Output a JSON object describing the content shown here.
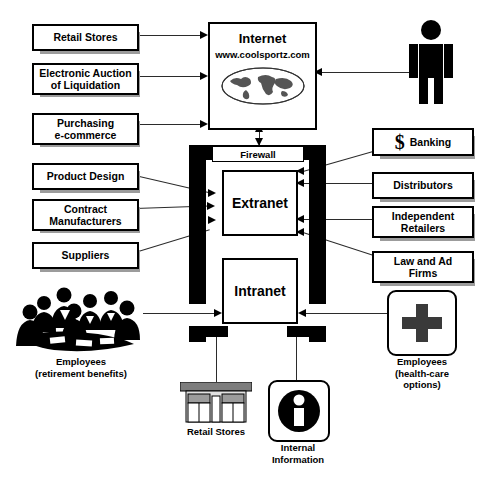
{
  "diagram": {
    "colors": {
      "line": "#2b2b2b",
      "shadow": "#9c9c9c",
      "fill": "#ffffff",
      "stroke": "#000000"
    }
  },
  "internet": {
    "title": "Internet",
    "url": "www.coolsportz.com",
    "globe_icon": "world-globe-icon"
  },
  "firewall": {
    "label": "Firewall"
  },
  "zones": {
    "extranet": "Extranet",
    "intranet": "Intranet"
  },
  "left_partners": [
    {
      "label": "Retail Stores",
      "target": "internet"
    },
    {
      "label": "Electronic Auction\nof Liquidation",
      "target": "internet"
    },
    {
      "label": "Purchasing\ne-commerce",
      "target": "internet"
    },
    {
      "label": "Product Design",
      "target": "extranet"
    },
    {
      "label": "Contract\nManufacturers",
      "target": "extranet"
    },
    {
      "label": "Suppliers",
      "target": "extranet"
    }
  ],
  "right_partners": [
    {
      "label": "Banking",
      "icon": "dollar-sign-icon",
      "icon_glyph": "$",
      "target": "extranet"
    },
    {
      "label": "Distributors",
      "icon": null,
      "target": "extranet"
    },
    {
      "label": "Independent\nRetailers",
      "icon": null,
      "target": "extranet"
    },
    {
      "label": "Law and Ad\nFirms",
      "icon": null,
      "target": "extranet"
    }
  ],
  "actors": {
    "customer": {
      "icon": "person-standing-icon",
      "label": ""
    },
    "employees_left": {
      "icon": "people-meeting-icon",
      "label": "Employees\n(retirement benefits)"
    },
    "employees_right": {
      "icon": "medical-cross-icon",
      "label": "Employees\n(health-care\noptions)"
    },
    "retail_stores_bottom": {
      "icon": "storefront-icon",
      "label": "Retail Stores"
    },
    "internal_information": {
      "icon": "information-i-icon",
      "label": "Internal\nInformation"
    }
  }
}
